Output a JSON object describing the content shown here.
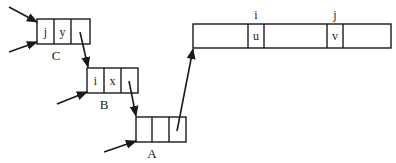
{
  "diagram": {
    "type": "pointer-record diagram",
    "records": {
      "C": {
        "label": "C",
        "cells": [
          "j",
          "y",
          ""
        ]
      },
      "B": {
        "label": "B",
        "cells": [
          "i",
          "x",
          ""
        ]
      },
      "A": {
        "label": "A",
        "cells": [
          "",
          "",
          ""
        ]
      },
      "array": {
        "cells": [
          "",
          "u",
          "",
          "v",
          ""
        ],
        "index_labels": {
          "i": "i",
          "j": "j"
        }
      }
    },
    "edges": [
      {
        "from": "external",
        "to": "C",
        "note": "incoming pointer (upper)"
      },
      {
        "from": "external",
        "to": "C",
        "note": "incoming pointer (lower)"
      },
      {
        "from": "external",
        "to": "B"
      },
      {
        "from": "external",
        "to": "A"
      },
      {
        "from": "C.cell3",
        "to": "B"
      },
      {
        "from": "B.cell3",
        "to": "A"
      },
      {
        "from": "A.cell3",
        "to": "array"
      }
    ]
  }
}
